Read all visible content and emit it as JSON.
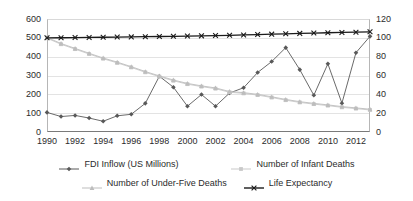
{
  "chart_data": {
    "type": "line",
    "title": "",
    "subtitle": "",
    "xlabel": "",
    "ylabel": "",
    "y2label": "",
    "grid": true,
    "legend_position": "bottom",
    "x": [
      1990,
      1991,
      1992,
      1993,
      1994,
      1995,
      1996,
      1997,
      1998,
      1999,
      2000,
      2001,
      2002,
      2003,
      2004,
      2005,
      2006,
      2007,
      2008,
      2009,
      2010,
      2011,
      2012,
      2013
    ],
    "xtick_labels": [
      "1990",
      "1992",
      "1994",
      "1996",
      "1998",
      "2000",
      "2002",
      "2004",
      "2006",
      "2008",
      "2010",
      "2012"
    ],
    "xtick_values": [
      1990,
      1992,
      1994,
      1996,
      1998,
      2000,
      2002,
      2004,
      2006,
      2008,
      2010,
      2012
    ],
    "ylim": [
      0,
      600
    ],
    "ytick_labels": [
      "0",
      "100",
      "200",
      "300",
      "400",
      "500",
      "600"
    ],
    "ytick_values": [
      0,
      100,
      200,
      300,
      400,
      500,
      600
    ],
    "y2lim": [
      0,
      120
    ],
    "y2tick_labels": [
      "0",
      "20",
      "40",
      "60",
      "80",
      "100",
      "120"
    ],
    "y2tick_values": [
      0,
      20,
      40,
      60,
      80,
      100,
      120
    ],
    "series": [
      {
        "name": "FDI Inflow (US Millions)",
        "axis": "left",
        "color": "#595959",
        "marker": "diamond",
        "values": [
          104,
          82,
          88,
          74,
          57,
          86,
          94,
          152,
          296,
          238,
          137,
          199,
          137,
          207,
          235,
          316,
          374,
          448,
          331,
          195,
          362,
          153,
          421,
          508
        ]
      },
      {
        "name": "Number of Infant Deaths",
        "axis": "left",
        "color": "#c9c9c9",
        "marker": "square",
        "values": [
          498,
          466,
          440,
          414,
          389,
          367,
          343,
          317,
          294,
          272,
          254,
          241,
          230,
          211,
          205,
          196,
          183,
          169,
          157,
          148,
          140,
          131,
          124,
          117
        ]
      },
      {
        "name": "Number of Under-Five Deaths",
        "axis": "left",
        "color": "#bdbdbd",
        "marker": "triangle",
        "values": [
          502,
          470,
          444,
          418,
          393,
          371,
          347,
          321,
          298,
          276,
          258,
          245,
          234,
          215,
          209,
          200,
          187,
          173,
          161,
          152,
          144,
          135,
          128,
          121
        ]
      },
      {
        "name": "Life Expectancy",
        "axis": "right",
        "color": "#1a1a1a",
        "marker": "x",
        "values": [
          100.0,
          100.1,
          100.3,
          100.4,
          100.6,
          100.8,
          101.0,
          101.2,
          101.4,
          101.6,
          101.9,
          102.1,
          102.4,
          102.7,
          103.1,
          103.5,
          103.9,
          104.3,
          104.7,
          105.1,
          105.4,
          105.7,
          106.0,
          106.4
        ]
      }
    ]
  },
  "legend": {
    "rows": [
      [
        {
          "label": "FDI Inflow (US Millions)",
          "key": "line-diamond-dark"
        },
        {
          "label": "Number of Infant Deaths",
          "key": "line-square-light"
        }
      ],
      [
        {
          "label": "Number of Under-Five Deaths",
          "key": "line-triangle-light"
        },
        {
          "label": "Life Expectancy",
          "key": "line-x-black"
        }
      ]
    ]
  }
}
